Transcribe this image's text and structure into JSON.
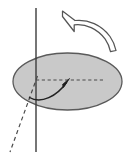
{
  "figure": {
    "type": "physics-diagram",
    "canvas": {
      "width": 130,
      "height": 163,
      "background": "#ffffff"
    },
    "colors": {
      "disk_fill": "#c9c9c9",
      "disk_stroke": "#5a5a5a",
      "axis_stroke": "#3c3c3c",
      "dashed_stroke": "#4a4a4a",
      "arrow_fill": "#ffffff",
      "arrow_stroke": "#555555",
      "angle_arrow": "#222222"
    },
    "elements": [
      {
        "name": "rotation-axis",
        "kind": "line",
        "style": "solid",
        "x1": 36,
        "y1": 8,
        "x2": 36,
        "y2": 152
      },
      {
        "name": "disk",
        "kind": "ellipse",
        "cx": 67.5,
        "cy": 81.5,
        "rx": 54.5,
        "ry": 28.5,
        "fill": "#c9c9c9"
      },
      {
        "name": "reference-radius",
        "kind": "line",
        "style": "dashed",
        "x1": 36,
        "y1": 80,
        "x2": 104,
        "y2": 80
      },
      {
        "name": "tilted-reference-line",
        "kind": "line",
        "style": "dashed",
        "x1": 37,
        "y1": 78,
        "x2": 10,
        "y2": 152
      },
      {
        "name": "angular-displacement-arrow",
        "kind": "curved-arrow",
        "path": "M 30 98 C 42 104, 58 94, 67 82",
        "arrowhead_at": {
          "x": 68,
          "y": 80
        }
      },
      {
        "name": "rotation-direction-arrow",
        "kind": "outlined-curved-arrow",
        "from": {
          "x": 113,
          "y": 50
        },
        "to": {
          "x": 60,
          "y": 20
        },
        "direction": "counterclockwise"
      }
    ]
  }
}
